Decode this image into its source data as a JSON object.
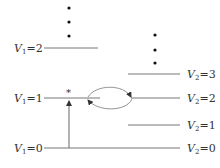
{
  "diagram": {
    "type": "energy-level-diagram",
    "left_levels": [
      {
        "var": "V",
        "sub": "1",
        "value": "2",
        "y": 48
      },
      {
        "var": "V",
        "sub": "1",
        "value": "1",
        "y": 98
      },
      {
        "var": "V",
        "sub": "1",
        "value": "0",
        "y": 148
      }
    ],
    "right_levels": [
      {
        "var": "V",
        "sub": "2",
        "value": "3",
        "y": 74
      },
      {
        "var": "V",
        "sub": "2",
        "value": "2",
        "y": 98
      },
      {
        "var": "V",
        "sub": "2",
        "value": "1",
        "y": 125
      },
      {
        "var": "V",
        "sub": "2",
        "value": "0",
        "y": 148
      }
    ],
    "excited_marker": "*",
    "continuation_symbol": "⋮",
    "transitions": [
      {
        "from": "V1=0",
        "to": "V1=1",
        "type": "excitation-arrow"
      },
      {
        "from": "V1=1",
        "to": "V2=2",
        "type": "energy-transfer-upper"
      },
      {
        "from": "V2=2",
        "to": "V1=1",
        "type": "energy-transfer-lower"
      }
    ],
    "colors": {
      "line": "#777777",
      "text": "#333333",
      "dot": "#111111"
    }
  },
  "labels": {
    "v1_2": {
      "eq": "=2"
    },
    "v1_1": {
      "eq": "=1"
    },
    "v1_0": {
      "eq": "=0"
    },
    "v2_3": {
      "eq": "=3"
    },
    "v2_2": {
      "eq": "=2"
    },
    "v2_1": {
      "eq": "=1"
    },
    "v2_0": {
      "eq": "=0"
    },
    "star": "*",
    "var": "V",
    "sub1": "1",
    "sub2": "2"
  }
}
